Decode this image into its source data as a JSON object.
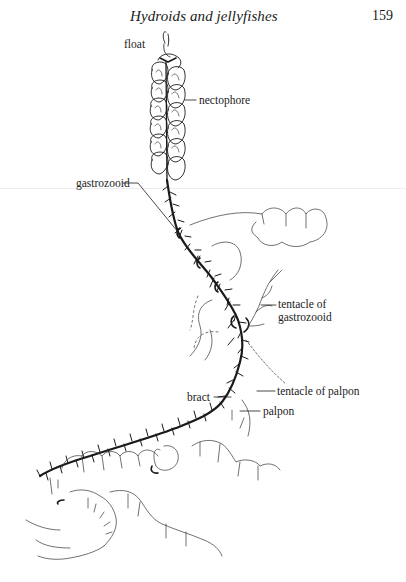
{
  "page": {
    "running_title": "Hydroids and jellyfishes",
    "page_number": "159"
  },
  "figure": {
    "labels": {
      "float": "float",
      "nectophore": "nectophore",
      "gastrozooid": "gastrozooid",
      "tentacle_of_gastrozooid_line1": "tentacle of",
      "tentacle_of_gastrozooid_line2": "gastrozooid",
      "tentacle_of_palpon": "tentacle of palpon",
      "bract": "bract",
      "palpon": "palpon"
    }
  },
  "colors": {
    "ink": "#1a1a1a",
    "paper": "#ffffff",
    "faint_rule": "#ececec"
  }
}
